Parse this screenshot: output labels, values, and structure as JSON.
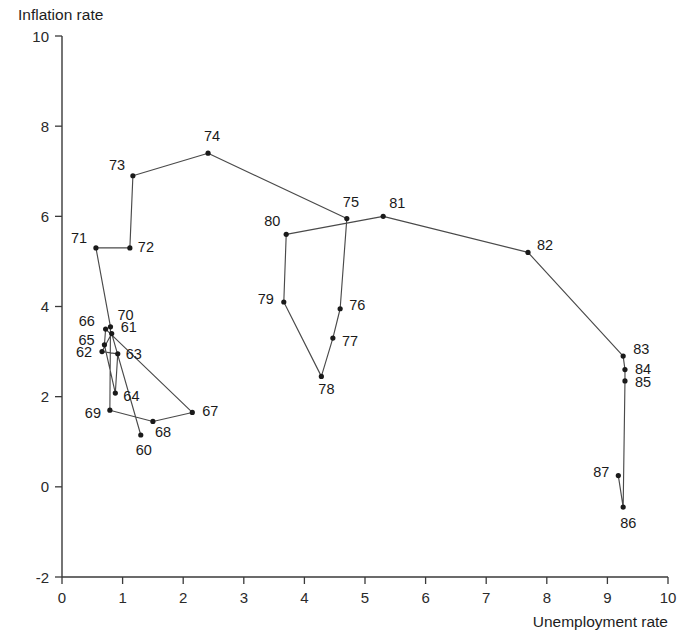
{
  "chart_data": {
    "type": "line",
    "title": "",
    "xlabel": "Unemployment rate",
    "ylabel": "Inflation rate",
    "xlim": [
      0,
      10
    ],
    "ylim": [
      -2,
      10
    ],
    "xticks": [
      "0",
      "1",
      "2",
      "3",
      "4",
      "5",
      "6",
      "7",
      "8",
      "9",
      "10"
    ],
    "yticks": [
      "-2",
      "0",
      "2",
      "4",
      "6",
      "8",
      "10"
    ],
    "grid": false,
    "legend": "none",
    "series": [
      {
        "name": "Phillips curve path 1960-1987",
        "point_labels": [
          "60",
          "61",
          "62",
          "63",
          "64",
          "65",
          "66",
          "67",
          "68",
          "69",
          "70",
          "71",
          "72",
          "73",
          "74",
          "75",
          "76",
          "77",
          "78",
          "79",
          "80",
          "81",
          "82",
          "83",
          "84",
          "85",
          "86",
          "87"
        ],
        "x": [
          1.3,
          0.82,
          0.66,
          0.92,
          0.88,
          0.7,
          0.72,
          2.15,
          1.5,
          0.79,
          0.8,
          0.56,
          1.12,
          1.17,
          2.41,
          4.7,
          4.59,
          4.47,
          4.28,
          3.66,
          3.7,
          5.3,
          7.69,
          9.26,
          9.29,
          9.29,
          9.26,
          9.18
        ],
        "y": [
          1.15,
          3.4,
          3.0,
          2.95,
          2.08,
          3.15,
          3.5,
          1.65,
          1.45,
          1.7,
          3.55,
          5.3,
          5.3,
          6.9,
          7.4,
          5.95,
          3.95,
          3.3,
          2.45,
          4.1,
          5.6,
          6.0,
          5.2,
          2.9,
          2.6,
          2.35,
          -0.45,
          0.25
        ]
      }
    ],
    "point_label_offsets": {
      "60": [
        -5,
        20
      ],
      "61": [
        9,
        -2
      ],
      "62": [
        -26,
        5
      ],
      "63": [
        8,
        5
      ],
      "64": [
        8,
        8
      ],
      "65": [
        -26,
        0
      ],
      "66": [
        -27,
        -3
      ],
      "67": [
        10,
        4
      ],
      "68": [
        2,
        16
      ],
      "69": [
        -25,
        8
      ],
      "70": [
        7,
        -7
      ],
      "71": [
        -25,
        -5
      ],
      "72": [
        8,
        4
      ],
      "73": [
        -24,
        -6
      ],
      "74": [
        -4,
        -12
      ],
      "75": [
        -4,
        -12
      ],
      "76": [
        9,
        1
      ],
      "77": [
        9,
        8
      ],
      "78": [
        -3,
        18
      ],
      "79": [
        -26,
        2
      ],
      "80": [
        -22,
        -8
      ],
      "81": [
        6,
        -8
      ],
      "82": [
        9,
        -2
      ],
      "83": [
        10,
        -2
      ],
      "84": [
        10,
        4
      ],
      "85": [
        10,
        6
      ],
      "86": [
        -3,
        21
      ],
      "87": [
        -25,
        1
      ]
    },
    "colors": {
      "line": "#4a4a4a",
      "dot": "#1a1a1a",
      "axis": "#3a3a3a",
      "text": "#1a1a1a",
      "background": "#ffffff"
    }
  }
}
